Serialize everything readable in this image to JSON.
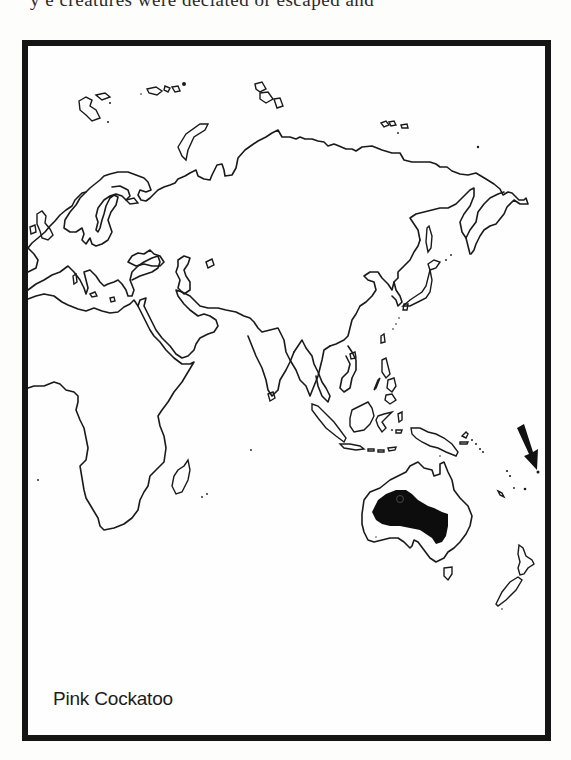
{
  "page": {
    "top_text_fragment": "y       e  creatures were deciated  or  escaped  and"
  },
  "map": {
    "caption": "Pink Cockatoo",
    "region_shown": "Eastern Hemisphere (Europe, Africa, Asia, Australia)",
    "highlighted_range": {
      "label": "Pink Cockatoo range",
      "location": "Interior Australia",
      "fill_color": "#0d0d0d"
    },
    "arrow": {
      "direction": "down-right",
      "points_to": "Pacific island east of Australia",
      "color": "#111111"
    },
    "colors": {
      "frame_border": "#151515",
      "coastline": "#1a1a1a",
      "background": "#fefefe"
    }
  }
}
